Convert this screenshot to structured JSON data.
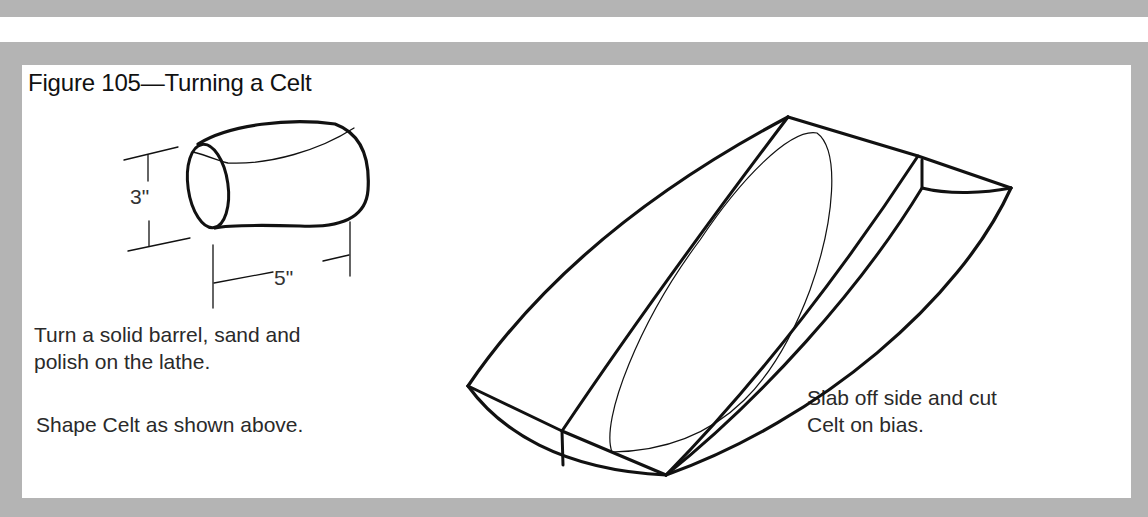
{
  "figure": {
    "title": "Figure 105—Turning a Celt",
    "barrel_dimensions": {
      "height_label": "3\"",
      "length_label": "5\""
    },
    "captions": {
      "turn_line1": "Turn a solid barrel, sand and",
      "turn_line2": "polish on the lathe.",
      "shape": "Shape Celt as shown above.",
      "slab_line1": "Slab off side and cut",
      "slab_line2": "Celt on bias."
    },
    "colors": {
      "frame": "#b4b4b4",
      "panel": "#ffffff",
      "ink": "#111111"
    }
  }
}
